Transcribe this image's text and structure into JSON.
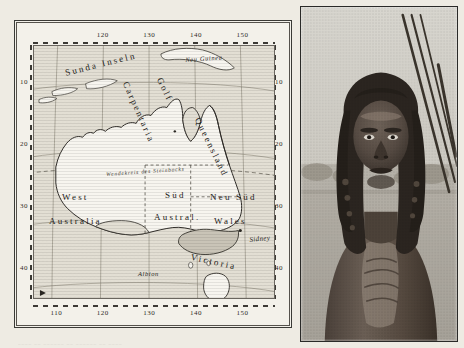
{
  "page": {
    "background_color": "#eeebe3",
    "caption_text": "____ __ ______ __ ______ __ ____"
  },
  "map": {
    "title_absent": true,
    "frame_color": "#3a3a36",
    "land_color": "#f7f5ef",
    "sea_color": "#e2ded3",
    "victoria_fill": "#c9c4b7",
    "axes": {
      "top_ticks": [
        "120",
        "130",
        "140",
        "150"
      ],
      "bottom_ticks": [
        "110",
        "120",
        "130",
        "140",
        "150"
      ],
      "left_ticks": [
        "10",
        "20",
        "30",
        "40"
      ],
      "right_ticks": [
        "10",
        "20",
        "30",
        "40"
      ],
      "lon_range": [
        105,
        157
      ],
      "lat_range": [
        4,
        45
      ]
    },
    "labels": [
      {
        "name": "sunda-inseln",
        "text": "Sunda Inseln",
        "style": "region",
        "x": 30,
        "y": 22,
        "rotate": -14
      },
      {
        "name": "neu-guinea",
        "text": "Neu Guinea",
        "style": "small",
        "x": 151,
        "y": 10,
        "rotate": -4
      },
      {
        "name": "golf-carpentaria",
        "text": "Golf",
        "style": "region",
        "x": 130,
        "y": 30,
        "rotate": 64
      },
      {
        "name": "carpentaria",
        "text": "Carpentaria",
        "style": "region",
        "x": 96,
        "y": 34,
        "rotate": 66
      },
      {
        "name": "queensland",
        "text": "Queensland",
        "style": "region",
        "x": 168,
        "y": 70,
        "rotate": 64
      },
      {
        "name": "tropic-capricorn",
        "text": "Wendekreis des Steinbocks",
        "style": "tropic",
        "x": 72,
        "y": 125,
        "rotate": -4
      },
      {
        "name": "west-australia-1",
        "text": "West",
        "style": "state",
        "x": 28,
        "y": 146,
        "rotate": 0
      },
      {
        "name": "west-australia-2",
        "text": "Australia",
        "style": "state",
        "x": 15,
        "y": 170,
        "rotate": 0
      },
      {
        "name": "sued-australien-1",
        "text": "Süd",
        "style": "state",
        "x": 131,
        "y": 144,
        "rotate": 0
      },
      {
        "name": "sued-australien-2",
        "text": "Austral.",
        "style": "state",
        "x": 120,
        "y": 166,
        "rotate": 0
      },
      {
        "name": "neu-sued-wales-1",
        "text": "Neu Süd",
        "style": "state",
        "x": 176,
        "y": 146,
        "rotate": 0
      },
      {
        "name": "neu-sued-wales-2",
        "text": "Wales",
        "style": "state",
        "x": 180,
        "y": 170,
        "rotate": 0
      },
      {
        "name": "victoria",
        "text": "Victoria",
        "style": "state",
        "x": 158,
        "y": 206,
        "rotate": 12
      },
      {
        "name": "sidney",
        "text": "Sidney",
        "style": "city",
        "x": 215,
        "y": 190,
        "rotate": -6
      },
      {
        "name": "albion",
        "text": "Albion",
        "style": "small",
        "x": 104,
        "y": 224,
        "rotate": 0
      },
      {
        "name": "van-diemensland",
        "text": "Van Diemensland",
        "style": "small",
        "x": 112,
        "y": 252,
        "rotate": 0
      },
      {
        "name": "tasmania",
        "text": "Tasmania",
        "style": "small",
        "x": 196,
        "y": 254,
        "rotate": 0
      }
    ]
  },
  "photo": {
    "subject": "portrait of a man with long hair, bare chest",
    "background": "open landscape, light sky",
    "objects": "several long spears leaning at upper right",
    "tone": "black-and-white halftone print"
  }
}
